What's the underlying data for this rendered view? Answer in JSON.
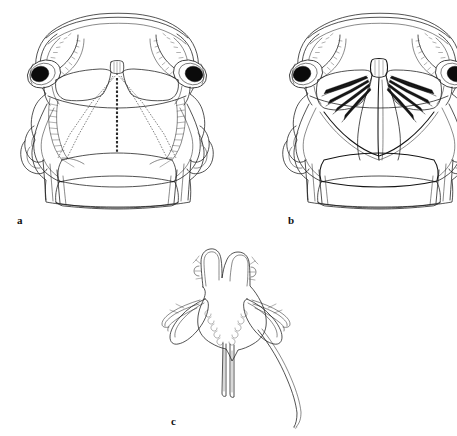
{
  "figure": {
    "kind": "scientific-line-drawing-plate",
    "background_color": "#ffffff",
    "ink_color": "#1a1a1a",
    "panel_count": 3,
    "width_px": 457,
    "height_px": 436
  },
  "panels": [
    {
      "id": "a",
      "label": "a",
      "label_x": 17,
      "label_y": 215,
      "view": "dorsal carapace and anterior body",
      "features": [
        "rounded anterior carapace margin",
        "paired dark compound eyes on stalks",
        "serrated antero-lateral carapace margins",
        "dashed V-shaped median sutures",
        "dashed median longitudinal line",
        "two transverse body somites",
        "lateral appendages with subchelate segments"
      ]
    },
    {
      "id": "b",
      "label": "b",
      "label_x": 288,
      "label_y": 215,
      "view": "ventral carapace and anterior body",
      "features": [
        "rounded anterior carapace margin",
        "paired dark compound eyes on stalks",
        "serrated antero-lateral carapace margins",
        "dark wedge-shaped mouthpart bundles radiating laterally",
        "solid median longitudinal ridge",
        "two transverse body somites",
        "lateral appendages with subchelate segments"
      ]
    },
    {
      "id": "c",
      "label": "c",
      "label_x": 171,
      "label_y": 416,
      "view": "isolated telson and uropods",
      "features": [
        "paired anterior lobes with apical spinules",
        "lateral marginal denticles",
        "paired elongate uropodal rami",
        "two straight median rods",
        "long curved distal flagellum extending posteriorly to the right"
      ]
    }
  ],
  "labels": {
    "a": "a",
    "b": "b",
    "c": "c"
  }
}
